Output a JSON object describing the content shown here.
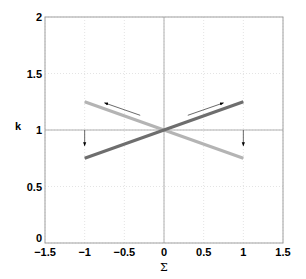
{
  "chart_data": {
    "type": "line",
    "title": "",
    "xlabel": "Σ",
    "ylabel": "k",
    "xlim": [
      -1.5,
      1.5
    ],
    "ylim": [
      0,
      2
    ],
    "xticks": [
      -1.5,
      -1,
      -0.5,
      0,
      0.5,
      1,
      1.5
    ],
    "yticks": [
      0,
      0.5,
      1,
      1.5,
      2
    ],
    "xtick_labels": [
      "−1.5",
      "−1",
      "−0.5",
      "0",
      "0.5",
      "1",
      "1.5"
    ],
    "ytick_labels": [
      "0",
      "0.5",
      "1",
      "1.5",
      "2"
    ],
    "grid": true,
    "legend": null,
    "series": [
      {
        "name": "dark line",
        "color": "#6e6e6e",
        "x": [
          -1,
          1
        ],
        "y": [
          0.75,
          1.25
        ]
      },
      {
        "name": "light line",
        "color": "#b4b4b4",
        "x": [
          -1,
          1
        ],
        "y": [
          1.25,
          0.75
        ]
      }
    ],
    "reference_lines": [
      {
        "orientation": "horizontal",
        "value": 1
      },
      {
        "orientation": "vertical",
        "value": 0
      }
    ],
    "annotations": [
      {
        "type": "arrow",
        "from": [
          -0.3,
          1.13
        ],
        "to": [
          -0.75,
          1.24
        ]
      },
      {
        "type": "arrow",
        "from": [
          0.3,
          1.13
        ],
        "to": [
          0.75,
          1.24
        ]
      },
      {
        "type": "arrow",
        "from": [
          -1,
          1.0
        ],
        "to": [
          -1,
          0.86
        ]
      },
      {
        "type": "arrow",
        "from": [
          1,
          1.0
        ],
        "to": [
          1,
          0.86
        ]
      }
    ]
  }
}
